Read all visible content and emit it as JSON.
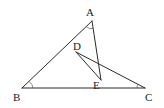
{
  "diagram": {
    "type": "geometry",
    "points": {
      "A": {
        "label": "A",
        "x": 92,
        "y": 21
      },
      "B": {
        "label": "B",
        "x": 22,
        "y": 88
      },
      "C": {
        "label": "C",
        "x": 145,
        "y": 88
      },
      "D": {
        "label": "D",
        "x": 76,
        "y": 52
      },
      "E": {
        "label": "E",
        "x": 101,
        "y": 80
      }
    },
    "segments": [
      "AB",
      "BC",
      "AE",
      "DE",
      "DC"
    ],
    "angle_marks": [
      "A",
      "B",
      "C"
    ]
  }
}
